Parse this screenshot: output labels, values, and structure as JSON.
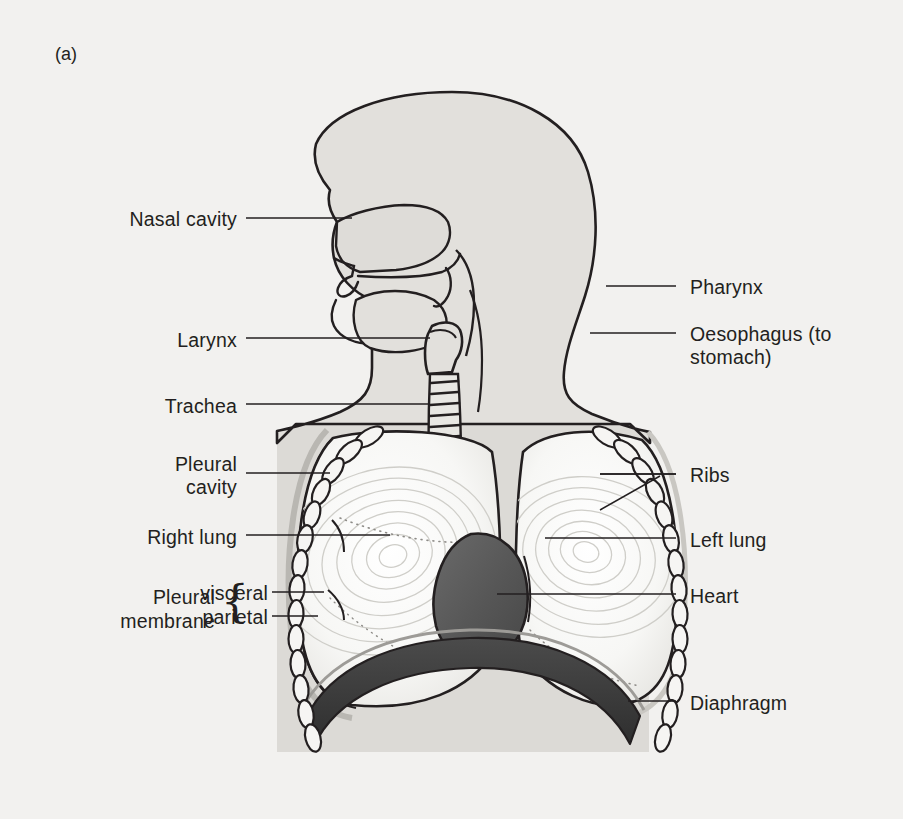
{
  "figure": {
    "panel_tag": "(a)",
    "background_color": "#f2f1ef",
    "ink_color": "#231f20",
    "backdrop_gray": "#dcdad6",
    "body_fill": "#e2e0dc",
    "heart_fill": "#5a5a5a",
    "diaphragm_fill": "#3a3a3a",
    "lung_fill": "#fafaf8"
  },
  "labels_left": [
    {
      "id": "nasal-cavity",
      "text": "Nasal cavity",
      "text_x": 237,
      "text_y": 223,
      "line_x1": 246,
      "line_y1": 218,
      "line_x2": 352,
      "line_y2": 218
    },
    {
      "id": "larynx",
      "text": "Larynx",
      "text_x": 237,
      "text_y": 344,
      "line_x1": 246,
      "line_y1": 338,
      "line_x2": 430,
      "line_y2": 338
    },
    {
      "id": "trachea",
      "text": "Trachea",
      "text_x": 237,
      "text_y": 410,
      "line_x1": 246,
      "line_y1": 404,
      "line_x2": 430,
      "line_y2": 404
    },
    {
      "id": "pleural-cavity",
      "text": "Pleural\ncavity",
      "text_x": 237,
      "text_y": 468,
      "line_x1": 246,
      "line_y1": 473,
      "line_x2": 330,
      "line_y2": 473
    },
    {
      "id": "right-lung",
      "text": "Right lung",
      "text_x": 237,
      "text_y": 541,
      "line_x1": 246,
      "line_y1": 535,
      "line_x2": 390,
      "line_y2": 535
    },
    {
      "id": "pleural-visceral",
      "text": "visceral",
      "text_x": 268,
      "text_y": 597,
      "line_x1": 272,
      "line_y1": 592,
      "line_x2": 324,
      "line_y2": 592
    },
    {
      "id": "pleural-parietal",
      "text": "parietal",
      "text_x": 268,
      "text_y": 621,
      "line_x1": 272,
      "line_y1": 616,
      "line_x2": 318,
      "line_y2": 616
    }
  ],
  "labels_left_extra": {
    "pleural_word": "Pleural",
    "membrane_word": "membrane",
    "brace": "{"
  },
  "labels_right": [
    {
      "id": "pharynx",
      "text": "Pharynx",
      "text_x": 690,
      "text_y": 291,
      "line_x1": 606,
      "line_y1": 286,
      "line_x2": 676,
      "line_y2": 286
    },
    {
      "id": "oesophagus",
      "text": "Oesophagus (to\nstomach)",
      "text_x": 690,
      "text_y": 338,
      "line_x1": 590,
      "line_y1": 333,
      "line_x2": 676,
      "line_y2": 333
    },
    {
      "id": "ribs",
      "text": "Ribs",
      "text_x": 690,
      "text_y": 479,
      "line_x1": 600,
      "line_y1": 474,
      "line_x2": 676,
      "line_y2": 474
    },
    {
      "id": "left-lung",
      "text": "Left lung",
      "text_x": 690,
      "text_y": 544,
      "line_x1": 545,
      "line_y1": 538,
      "line_x2": 676,
      "line_y2": 538
    },
    {
      "id": "heart",
      "text": "Heart",
      "text_x": 690,
      "text_y": 600,
      "line_x1": 497,
      "line_y1": 594,
      "line_x2": 676,
      "line_y2": 594
    },
    {
      "id": "diaphragm",
      "text": "Diaphragm",
      "text_x": 690,
      "text_y": 707,
      "line_x1": 628,
      "line_y1": 701,
      "line_x2": 676,
      "line_y2": 701
    }
  ],
  "structures": [
    "head",
    "nasal-cavity",
    "oral-cavity",
    "tongue",
    "pharynx",
    "larynx",
    "trachea",
    "oesophagus",
    "bronchi",
    "right-lung",
    "left-lung",
    "heart",
    "diaphragm",
    "ribs",
    "pleural-membrane",
    "pleural-cavity"
  ]
}
